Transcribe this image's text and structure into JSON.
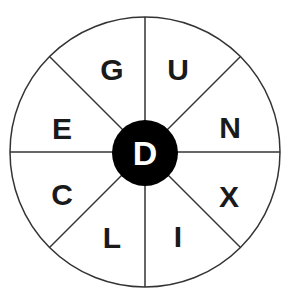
{
  "puzzle": {
    "type": "word-wheel",
    "center_letter": "D",
    "outer_letters": [
      {
        "position": "top-right",
        "letter": "U"
      },
      {
        "position": "right-upper",
        "letter": "N"
      },
      {
        "position": "right-lower",
        "letter": "X"
      },
      {
        "position": "bottom-right",
        "letter": "I"
      },
      {
        "position": "bottom-left",
        "letter": "L"
      },
      {
        "position": "left-lower",
        "letter": "C"
      },
      {
        "position": "left-upper",
        "letter": "E"
      },
      {
        "position": "top-left",
        "letter": "G"
      }
    ],
    "colors": {
      "outline": "#333333",
      "center_fill": "#000000",
      "center_text": "#ffffff",
      "letter_text": "#1a1a1a",
      "background": "#ffffff"
    }
  }
}
